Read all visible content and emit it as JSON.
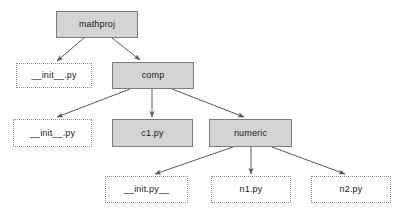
{
  "diagram": {
    "type": "tree",
    "colors": {
      "package_fill": "#d4d4d4",
      "package_border": "#7c7c7c",
      "module_fill": "#ffffff",
      "module_border": "#8d8d8d",
      "edge": "#5a5a5a",
      "background": "#ffffff",
      "text": "#1a1a1a"
    },
    "nodes": [
      {
        "id": "mathproj",
        "label": "mathproj",
        "kind": "package",
        "x": 56,
        "y": 11,
        "w": 82,
        "h": 27
      },
      {
        "id": "init-root",
        "label": "__init__.py",
        "kind": "module",
        "x": 16,
        "y": 63,
        "w": 76,
        "h": 25
      },
      {
        "id": "comp",
        "label": "comp",
        "kind": "package",
        "x": 112,
        "y": 62,
        "w": 82,
        "h": 27
      },
      {
        "id": "init-comp",
        "label": "__init__.py",
        "kind": "module",
        "x": 13,
        "y": 119,
        "w": 79,
        "h": 28
      },
      {
        "id": "c1",
        "label": "c1.py",
        "kind": "package",
        "x": 112,
        "y": 119,
        "w": 81,
        "h": 28
      },
      {
        "id": "numeric",
        "label": "numeric",
        "kind": "package",
        "x": 209,
        "y": 119,
        "w": 83,
        "h": 28
      },
      {
        "id": "init-numeric",
        "label": "__init.py__",
        "kind": "module",
        "x": 105,
        "y": 176,
        "w": 83,
        "h": 27
      },
      {
        "id": "n1",
        "label": "n1.py",
        "kind": "module",
        "x": 211,
        "y": 176,
        "w": 80,
        "h": 27
      },
      {
        "id": "n2",
        "label": "n2.py",
        "kind": "module",
        "x": 311,
        "y": 176,
        "w": 80,
        "h": 27
      }
    ],
    "edges": [
      {
        "id": "edge-mathproj-init",
        "from": "mathproj",
        "to": "init-root",
        "x1": 84,
        "y1": 38,
        "x2": 57,
        "y2": 61
      },
      {
        "id": "edge-mathproj-comp",
        "from": "mathproj",
        "to": "comp",
        "x1": 112,
        "y1": 38,
        "x2": 140,
        "y2": 60
      },
      {
        "id": "edge-comp-init",
        "from": "comp",
        "to": "init-comp",
        "x1": 130,
        "y1": 89,
        "x2": 57,
        "y2": 117
      },
      {
        "id": "edge-comp-c1",
        "from": "comp",
        "to": "c1",
        "x1": 152,
        "y1": 89,
        "x2": 152,
        "y2": 117
      },
      {
        "id": "edge-comp-numeric",
        "from": "comp",
        "to": "numeric",
        "x1": 172,
        "y1": 89,
        "x2": 244,
        "y2": 117
      },
      {
        "id": "edge-numeric-init",
        "from": "numeric",
        "to": "init-numeric",
        "x1": 233,
        "y1": 147,
        "x2": 155,
        "y2": 174
      },
      {
        "id": "edge-numeric-n1",
        "from": "numeric",
        "to": "n1",
        "x1": 251,
        "y1": 147,
        "x2": 251,
        "y2": 174
      },
      {
        "id": "edge-numeric-n2",
        "from": "numeric",
        "to": "n2",
        "x1": 272,
        "y1": 147,
        "x2": 345,
        "y2": 174
      }
    ]
  }
}
